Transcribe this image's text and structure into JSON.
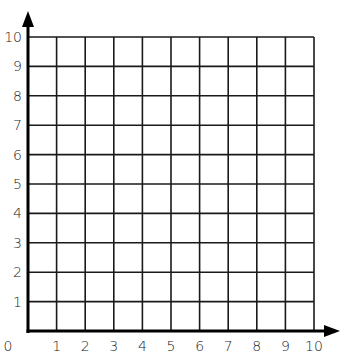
{
  "diagram": {
    "type": "coordinate-grid",
    "quadrant": "first",
    "x_axis": {
      "min": 0,
      "max": 10,
      "step": 1,
      "tick_labels": [
        "0",
        "1",
        "2",
        "3",
        "4",
        "5",
        "6",
        "7",
        "8",
        "9",
        "10"
      ],
      "arrow": "right"
    },
    "y_axis": {
      "min": 0,
      "max": 10,
      "step": 1,
      "tick_labels": [
        "1",
        "2",
        "3",
        "4",
        "5",
        "6",
        "7",
        "8",
        "9",
        "10"
      ],
      "arrow": "up"
    },
    "origin_label": "0",
    "grid": true,
    "colors": {
      "background": "#ffffff",
      "grid_line": "#1a1a1a",
      "axis": "#000000",
      "label": "#222222"
    }
  }
}
